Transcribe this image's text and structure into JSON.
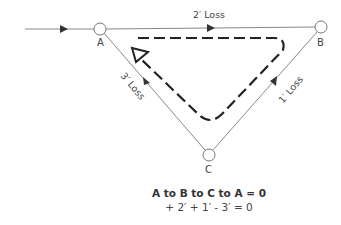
{
  "diagram": {
    "nodes": [
      {
        "id": "A",
        "label": "A"
      },
      {
        "id": "B",
        "label": "B"
      },
      {
        "id": "C",
        "label": "C"
      }
    ],
    "edges": [
      {
        "from": "A",
        "to": "B",
        "label": "2′ Loss"
      },
      {
        "from": "B",
        "to": "C",
        "label": "1′ Loss"
      },
      {
        "from": "A",
        "to": "C",
        "label": "3′ Loss"
      }
    ],
    "loop_direction": "A to B to C to A (clockwise dashed path)",
    "equation_title": "A to B to C to A = 0",
    "equation": "+ 2′ + 1′ - 3′ = 0"
  },
  "colors": {
    "line": "#888888",
    "arrow": "#333333",
    "dashed": "#222222"
  }
}
